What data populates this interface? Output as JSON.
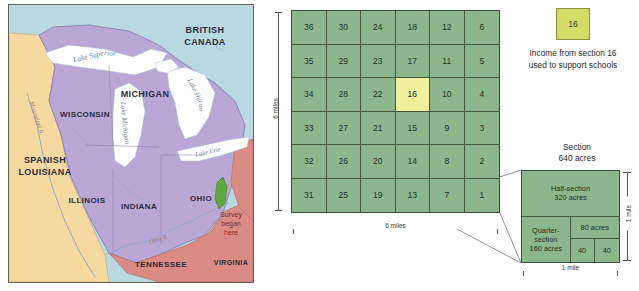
{
  "map": {
    "name": "old-northwest-territory-map",
    "background_water_color": "#b9d9e2",
    "territory_color": "#b9a8d6",
    "spanish_color": "#f5d9a0",
    "southern_color": "#d98b84",
    "regions": [
      {
        "label": "BRITISH\nCANADA",
        "lines": [
          "BRITISH",
          "CANADA"
        ]
      },
      {
        "label": "MICHIGAN",
        "lines": [
          "MICHIGAN"
        ]
      },
      {
        "label": "WISCONSIN",
        "lines": [
          "WISCONSIN"
        ]
      },
      {
        "label": "SPANISH\nLOUISIANA",
        "lines": [
          "SPANISH",
          "LOUISIANA"
        ]
      },
      {
        "label": "ILLINOIS",
        "lines": [
          "ILLINOIS"
        ]
      },
      {
        "label": "INDIANA",
        "lines": [
          "INDIANA"
        ]
      },
      {
        "label": "OHIO",
        "lines": [
          "OHIO"
        ]
      },
      {
        "label": "TENNESSEE",
        "lines": [
          "TENNESSEE"
        ]
      },
      {
        "label": "VIRGINIA",
        "lines": [
          "VIRGINIA"
        ]
      }
    ],
    "labels": {
      "british_canada_1": "BRITISH",
      "british_canada_2": "CANADA",
      "michigan": "MICHIGAN",
      "wisconsin": "WISCONSIN",
      "spanish_1": "SPANISH",
      "spanish_2": "LOUISIANA",
      "illinois": "ILLINOIS",
      "indiana": "INDIANA",
      "ohio": "OHIO",
      "tennessee": "TENNESSEE",
      "virginia": "VIRGINIA"
    },
    "water_labels": {
      "lake_superior": "Lake Superior",
      "lake_michigan": "Lake Michigan",
      "lake_huron": "Lake Huron",
      "lake_erie": "Lake Erie",
      "mississippi": "Mississippi R.",
      "ohio_river": "Ohio R."
    },
    "annotation": {
      "survey_line_1": "Survey",
      "survey_line_2": "began",
      "survey_line_3": "here",
      "marker_color": "#5fa83c"
    }
  },
  "township": {
    "name": "township-grid",
    "rows": 6,
    "cols": 6,
    "cell_color": "#8cb68c",
    "highlight_color": "#f0ef9e",
    "highlight_section": "16",
    "sections": [
      [
        "36",
        "30",
        "24",
        "18",
        "12",
        "6"
      ],
      [
        "35",
        "29",
        "23",
        "17",
        "11",
        "5"
      ],
      [
        "34",
        "28",
        "22",
        "16",
        "10",
        "4"
      ],
      [
        "33",
        "27",
        "21",
        "15",
        "9",
        "3"
      ],
      [
        "32",
        "26",
        "20",
        "14",
        "8",
        "2"
      ],
      [
        "31",
        "25",
        "19",
        "13",
        "7",
        "1"
      ]
    ],
    "dim_width": "6 miles",
    "dim_height": "6 miles"
  },
  "legend": {
    "name": "section-16-legend",
    "swatch_label": "16",
    "swatch_color": "#d4dc6a",
    "caption_line_1": "Income from section 16",
    "caption_line_2": "used to support schools"
  },
  "section_detail": {
    "name": "section-subdivision-diagram",
    "title_line_1": "Section",
    "title_line_2": "640 acres",
    "fill_color": "#8cb68c",
    "parts": [
      {
        "key": "half",
        "line_1": "Half-section",
        "line_2": "320 acres"
      },
      {
        "key": "quarter",
        "line_1": "Quarter-",
        "line_2": "section",
        "line_3": "160 acres"
      },
      {
        "key": "eighty",
        "line_1": "80 acres"
      },
      {
        "key": "forty_a",
        "line_1": "40"
      },
      {
        "key": "forty_b",
        "line_1": "40"
      }
    ],
    "half_line_1": "Half-section",
    "half_line_2": "320 acres",
    "quarter_line_1": "Quarter-",
    "quarter_line_2": "section",
    "quarter_line_3": "160 acres",
    "eighty_label": "80 acres",
    "forty_a_label": "40",
    "forty_b_label": "40",
    "dim_width": "1 mile",
    "dim_height": "1 mile"
  }
}
